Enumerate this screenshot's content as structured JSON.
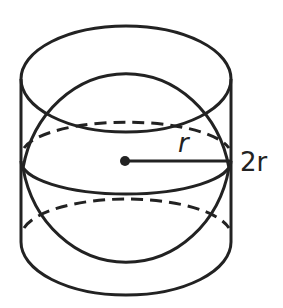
{
  "diagram": {
    "labels": {
      "radius": "r",
      "height": "2r"
    },
    "colors": {
      "stroke": "#222222",
      "background": "#ffffff"
    }
  }
}
